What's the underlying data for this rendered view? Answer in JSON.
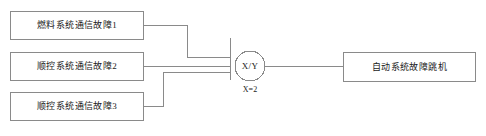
{
  "diagram": {
    "type": "fault-tree-voting-logic",
    "inputs": [
      {
        "id": "input-1",
        "label": "燃料系统通信故障1"
      },
      {
        "id": "input-2",
        "label": "顺控系统通信故障2"
      },
      {
        "id": "input-3",
        "label": "顺控系统通信故障3"
      }
    ],
    "gate": {
      "symbol": "X/Y",
      "condition": "X=2",
      "shape": "circle-voting-gate"
    },
    "output": {
      "id": "output-1",
      "label": "自动系统故障跳机"
    },
    "colors": {
      "stroke": "#8a8a8a",
      "text": "#1a1a1a",
      "background": "#ffffff"
    }
  }
}
